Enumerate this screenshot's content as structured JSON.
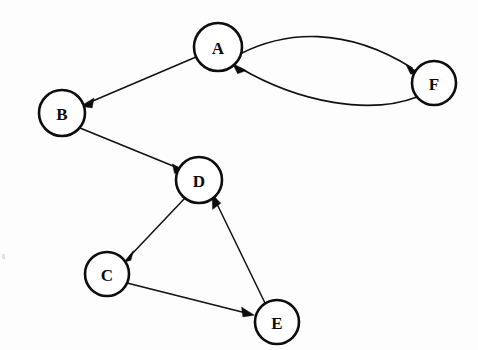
{
  "diagram": {
    "type": "directed-graph",
    "background_color": "#fdfdfd",
    "node_fill": "#ffffff",
    "node_stroke": "#0d0d0d",
    "edge_color": "#111111",
    "nodes": [
      {
        "id": "A",
        "label": "A",
        "cx": 218,
        "cy": 47,
        "r": 24
      },
      {
        "id": "B",
        "label": "B",
        "cx": 62,
        "cy": 113,
        "r": 23
      },
      {
        "id": "C",
        "label": "C",
        "cx": 107,
        "cy": 274,
        "r": 22
      },
      {
        "id": "D",
        "label": "D",
        "cx": 199,
        "cy": 180,
        "r": 23
      },
      {
        "id": "E",
        "label": "E",
        "cx": 277,
        "cy": 322,
        "r": 22
      },
      {
        "id": "F",
        "label": "F",
        "cx": 434,
        "cy": 83,
        "r": 22
      }
    ],
    "edges": [
      {
        "from": "A",
        "to": "B",
        "shape": "straight",
        "directed": true
      },
      {
        "from": "A",
        "to": "F",
        "shape": "curved-upper",
        "directed": true
      },
      {
        "from": "F",
        "to": "A",
        "shape": "curved-lower",
        "directed": true
      },
      {
        "from": "B",
        "to": "D",
        "shape": "straight",
        "directed": true
      },
      {
        "from": "D",
        "to": "C",
        "shape": "straight",
        "directed": true
      },
      {
        "from": "C",
        "to": "E",
        "shape": "straight",
        "directed": true
      },
      {
        "from": "E",
        "to": "D",
        "shape": "straight",
        "directed": true
      }
    ]
  }
}
